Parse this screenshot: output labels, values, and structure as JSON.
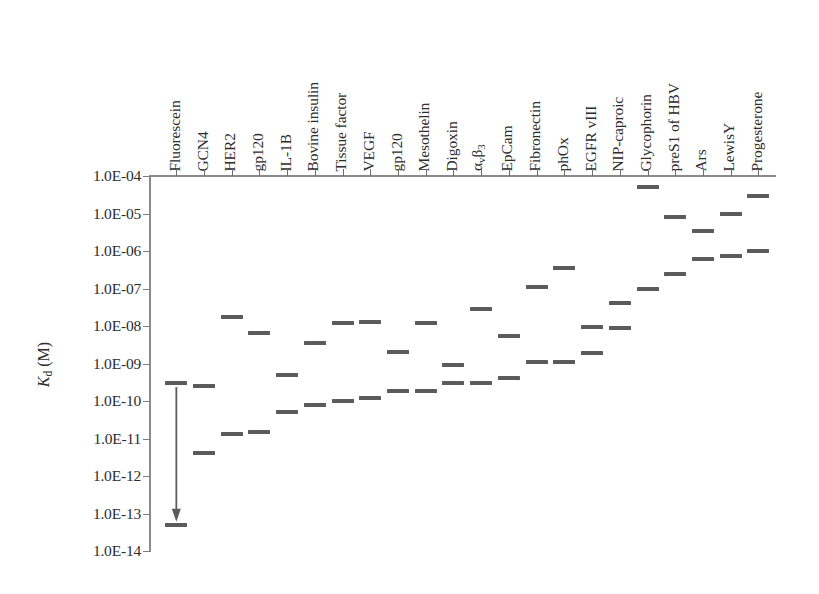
{
  "chart_data": {
    "type": "scatter",
    "title": "",
    "xlabel": "",
    "ylabel": "Kd (M)",
    "ylabel_rich": {
      "base": "K",
      "sub": "d",
      "unit": " (M)"
    },
    "yscale": "log",
    "ylim": [
      1e-14,
      0.0001
    ],
    "ytick_labels": [
      "1.0E-04",
      "1.0E-05",
      "1.0E-06",
      "1.0E-07",
      "1.0E-08",
      "1.0E-09",
      "1.0E-10",
      "1.0E-11",
      "1.0E-12",
      "1.0E-13",
      "1.0E-14"
    ],
    "ytick_values": [
      0.0001,
      1e-05,
      1e-06,
      1e-07,
      1e-08,
      1e-09,
      1e-10,
      1e-11,
      1e-12,
      1e-13,
      1e-14
    ],
    "grid": false,
    "legend": "none",
    "marker_color": "#5b5b5b",
    "axis_color": "#8a8a8a",
    "categories": [
      "Fluorescein",
      "GCN4",
      "HER2",
      "gp120",
      "IL-1B",
      "Bovine insulin",
      "Tissue factor",
      "VEGF",
      "gp120",
      "Mesothelin",
      "Digoxin",
      "αvβ3",
      "EpCam",
      "Fibronectin",
      "phOx",
      "EGFR vIII",
      "NIP-caproic",
      "Glycophorin",
      "preS1 of HBV",
      "Ars",
      "LewisY",
      "Progesterone"
    ],
    "category_labels_rich": [
      {
        "text": "Fluorescein"
      },
      {
        "text": "GCN4"
      },
      {
        "text": "HER2"
      },
      {
        "text": "gp120"
      },
      {
        "text": "IL-1B"
      },
      {
        "text": "Bovine insulin"
      },
      {
        "text": "Tissue factor"
      },
      {
        "text": "VEGF"
      },
      {
        "text": "gp120"
      },
      {
        "text": "Mesothelin"
      },
      {
        "text": "Digoxin"
      },
      {
        "text": "α",
        "sub1": "v",
        "text2": "β",
        "sub2": "3"
      },
      {
        "text": "EpCam"
      },
      {
        "text": "Fibronectin"
      },
      {
        "text": "phOx"
      },
      {
        "text": "EGFR vIII"
      },
      {
        "text": "NIP-caproic"
      },
      {
        "text": "Glycophorin"
      },
      {
        "text": "preS1 of HBV"
      },
      {
        "text": "Ars"
      },
      {
        "text": "LewisY"
      },
      {
        "text": "Progesterone"
      }
    ],
    "points": [
      {
        "category": "Fluorescein",
        "values": [
          3e-10,
          5e-14
        ]
      },
      {
        "category": "GCN4",
        "values": [
          2.5e-10,
          4e-12
        ]
      },
      {
        "category": "HER2",
        "values": [
          1.7e-08,
          1.3e-11
        ]
      },
      {
        "category": "gp120",
        "values": [
          6.5e-09,
          1.5e-11
        ]
      },
      {
        "category": "IL-1B",
        "values": [
          5e-10,
          5e-11
        ]
      },
      {
        "category": "Bovine insulin",
        "values": [
          3.5e-09,
          8e-11
        ]
      },
      {
        "category": "Tissue factor",
        "values": [
          1.2e-08,
          1e-10
        ]
      },
      {
        "category": "VEGF",
        "values": [
          1.3e-08,
          1.2e-10
        ]
      },
      {
        "category": "gp120",
        "values": [
          2e-09,
          1.8e-10
        ]
      },
      {
        "category": "Mesothelin",
        "values": [
          1.2e-08,
          1.9e-10
        ]
      },
      {
        "category": "Digoxin",
        "values": [
          9e-10,
          3e-10
        ]
      },
      {
        "category": "αvβ3",
        "values": [
          2.8e-08,
          3e-10
        ]
      },
      {
        "category": "EpCam",
        "values": [
          5.5e-09,
          4e-10
        ]
      },
      {
        "category": "Fibronectin",
        "values": [
          1.1e-07,
          1.1e-09
        ]
      },
      {
        "category": "phOx",
        "values": [
          3.5e-07,
          1.1e-09
        ]
      },
      {
        "category": "EGFR vIII",
        "values": [
          9.5e-09,
          1.9e-09
        ]
      },
      {
        "category": "NIP-caproic",
        "values": [
          4e-08,
          9e-09
        ]
      },
      {
        "category": "Glycophorin",
        "values": [
          5e-05,
          1e-07
        ]
      },
      {
        "category": "preS1 of HBV",
        "values": [
          8e-06,
          2.4e-07
        ]
      },
      {
        "category": "Ars",
        "values": [
          3.5e-06,
          6e-07
        ]
      },
      {
        "category": "LewisY",
        "values": [
          1e-05,
          7.5e-07
        ]
      },
      {
        "category": "Progesterone",
        "values": [
          3e-05,
          1e-06
        ]
      }
    ],
    "annotation": {
      "name": "affinity-range-arrow",
      "category": "Fluorescein",
      "from": 3e-10,
      "to": 5e-14,
      "direction": "down",
      "color": "#5b5b5b"
    }
  }
}
